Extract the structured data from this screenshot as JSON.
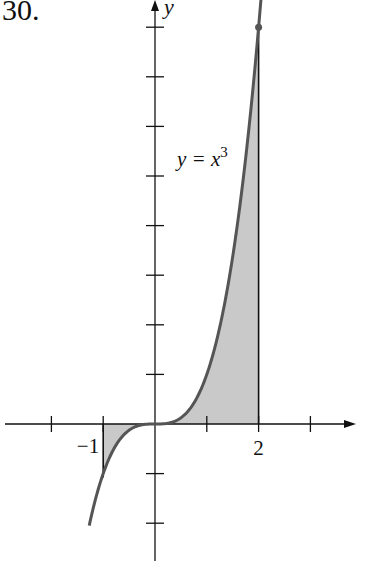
{
  "problem_number": "30.",
  "chart_data": {
    "type": "area",
    "title": "",
    "function": "y = x^3",
    "curve_label": "y = x",
    "curve_label_exponent": "3",
    "xlabel": "",
    "ylabel": "y",
    "x_tick_labels": [
      {
        "x": -1,
        "label": "−1"
      },
      {
        "x": 2,
        "label": "2"
      }
    ],
    "x_ticks": [
      -2,
      -1,
      1,
      2,
      3
    ],
    "y_ticks": [
      -2,
      -1,
      1,
      2,
      3,
      4,
      5,
      6,
      7,
      8
    ],
    "xlim": [
      -3,
      3.8
    ],
    "ylim": [
      -2.8,
      8.5
    ],
    "shaded_region": {
      "from_x": -1,
      "to_x": 2,
      "between": [
        "y = x^3",
        "y = 0"
      ]
    },
    "marked_point": {
      "x": 2,
      "y": 8
    },
    "curve_domain": [
      -1.27,
      2.05
    ],
    "grid": false,
    "legend": null,
    "colors": {
      "curve": "#555555",
      "fill": "#c9c9c9",
      "axes": "#111111"
    }
  }
}
